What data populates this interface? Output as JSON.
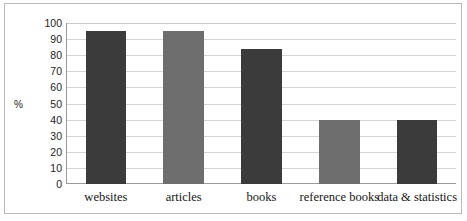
{
  "chart_data": {
    "type": "bar",
    "title": "",
    "subtitle": "",
    "xlabel": "",
    "ylabel": "%",
    "categories": [
      "websites",
      "articles",
      "books",
      "reference books",
      "data & statistics"
    ],
    "values": [
      95,
      95,
      84,
      40,
      40
    ],
    "series": [
      {
        "name": "",
        "values": [
          95,
          95,
          84,
          40,
          40
        ]
      }
    ],
    "ylim": [
      0,
      100
    ],
    "ytick_labels": [
      "100",
      "90",
      "80",
      "70",
      "60",
      "50",
      "40",
      "30",
      "20",
      "10",
      "0"
    ],
    "ytick_values": [
      100,
      90,
      80,
      70,
      60,
      50,
      40,
      30,
      20,
      10,
      0
    ],
    "grid": "horizontal",
    "legend": "none",
    "bar_colors": [
      "#3b3b3b",
      "#6e6e6e",
      "#3b3b3b",
      "#6e6e6e",
      "#3b3b3b"
    ],
    "gridline_color": "#d5d5d5",
    "axis_color": "#9a9a9a",
    "frame_color": "#b9b9b9",
    "background": "#ffffff",
    "annotations": []
  }
}
